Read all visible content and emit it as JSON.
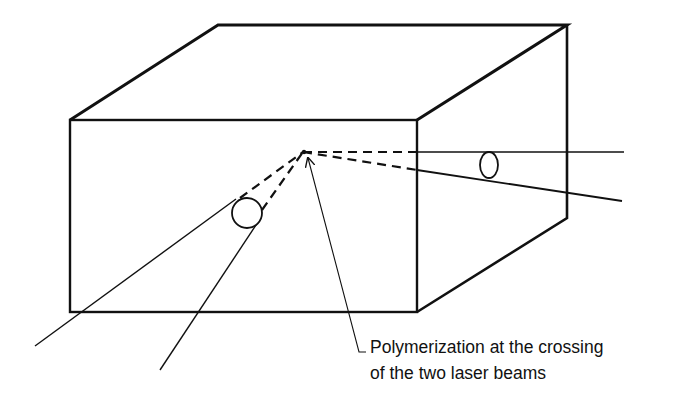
{
  "figure": {
    "type": "isometric box diagram with two laser beams crossing inside",
    "colors": {
      "ink": "#111111",
      "background": "#ffffff"
    },
    "box": {
      "front_face": [
        [
          70,
          120
        ],
        [
          417,
          120
        ],
        [
          417,
          312
        ],
        [
          70,
          312
        ]
      ],
      "top_face": [
        [
          70,
          120
        ],
        [
          218,
          25
        ],
        [
          567,
          25
        ],
        [
          417,
          120
        ]
      ],
      "right_face": [
        [
          417,
          120
        ],
        [
          567,
          25
        ],
        [
          567,
          218
        ],
        [
          417,
          312
        ]
      ]
    },
    "crossing_point": [
      303,
      152
    ],
    "beams": [
      {
        "name": "left-beam-1",
        "solid": [
          [
            35,
            346
          ],
          [
            240,
            198
          ]
        ],
        "dashed": [
          [
            240,
            198
          ],
          [
            303,
            152
          ]
        ]
      },
      {
        "name": "left-beam-2",
        "solid": [
          [
            160,
            370
          ],
          [
            258,
            222
          ]
        ],
        "dashed": [
          [
            262,
            210
          ],
          [
            303,
            152
          ]
        ]
      },
      {
        "name": "right-beam-horizontal",
        "dashed": [
          [
            303,
            152
          ],
          [
            417,
            152
          ]
        ],
        "solid": [
          [
            417,
            152
          ],
          [
            624,
            152
          ]
        ]
      },
      {
        "name": "right-beam-sloped",
        "dashed": [
          [
            303,
            152
          ],
          [
            417,
            170
          ]
        ],
        "solid": [
          [
            417,
            170
          ],
          [
            622,
            201
          ]
        ]
      }
    ],
    "lens_markers": [
      {
        "name": "left-beam-cross-section",
        "cx": 247,
        "cy": 213,
        "rx": 15,
        "ry": 15
      },
      {
        "name": "right-beam-cross-section",
        "cx": 489,
        "cy": 165,
        "rx": 9,
        "ry": 13
      }
    ],
    "leader_arrow": {
      "tip": [
        308,
        158
      ],
      "elbow": [
        358,
        352
      ],
      "foot_end": [
        366,
        352
      ]
    },
    "caption": {
      "line1": "Polymerization at the crossing",
      "line2": "of the two laser beams"
    }
  }
}
